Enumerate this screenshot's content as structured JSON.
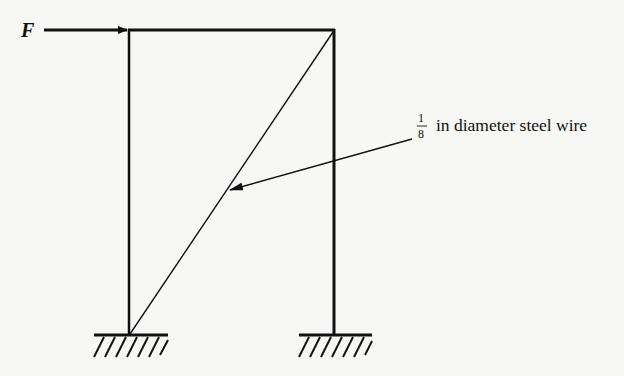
{
  "diagram": {
    "force_label": "F",
    "wire_label": {
      "fraction_numerator": "1",
      "fraction_denominator": "8",
      "text": "in diameter steel wire"
    },
    "colors": {
      "ink": "#111111",
      "background": "#f7f7f5"
    }
  }
}
